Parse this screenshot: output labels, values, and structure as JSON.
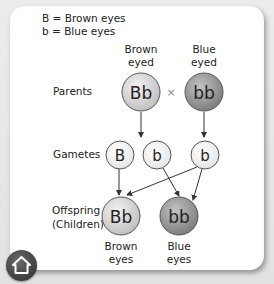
{
  "legend": {
    "line1": "B = Brown eyes",
    "line2": "b = Blue eyes"
  },
  "parents": {
    "row_label": "Parents",
    "left": {
      "header_line1": "Brown",
      "header_line2": "eyed",
      "genotype": "Bb"
    },
    "cross_symbol": "×",
    "right": {
      "header_line1": "Blue",
      "header_line2": "eyed",
      "genotype": "bb"
    }
  },
  "gametes": {
    "row_label": "Gametes",
    "items": [
      {
        "allele": "B"
      },
      {
        "allele": "b"
      },
      {
        "allele": "b"
      }
    ]
  },
  "offspring": {
    "row_label_line1": "Offspring",
    "row_label_line2": "(Children)",
    "items": [
      {
        "genotype": "Bb",
        "caption_line1": "Brown",
        "caption_line2": "eyes"
      },
      {
        "genotype": "bb",
        "caption_line1": "Blue",
        "caption_line2": "eyes"
      }
    ]
  },
  "colors": {
    "brown_allele_fill": "#d6d6d6",
    "blue_allele_fill": "#9a9a9a",
    "gamete_fill": "#f4f4f4",
    "stroke": "#555555"
  },
  "nav": {
    "home_icon": "home-icon"
  }
}
